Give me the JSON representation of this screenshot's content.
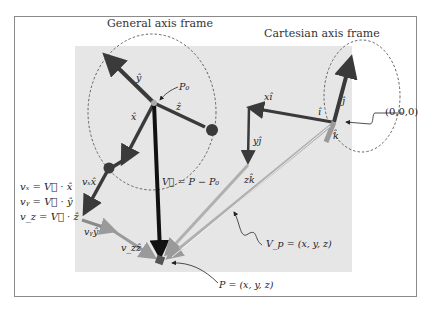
{
  "diagram": {
    "titles": {
      "general": "General axis frame",
      "cartesian": "Cartesian axis frame"
    },
    "labels": {
      "y_hat": "ŷ",
      "z_hat": "ẑ",
      "x_hat": "x̂",
      "p0": "P₀",
      "v_eq": "V⃗ = P − P₀",
      "vx_x": "vₓx̂",
      "vy_y": "vᵧŷ",
      "vz_z": "v_zẑ",
      "x_i": "xî",
      "i_hat": "î",
      "j_hat": "ĵ",
      "k_hat": "k̂",
      "y_j": "yĵ",
      "z_k": "zk̂",
      "origin": "(0,0,0)",
      "vp_eq": "V_p = (x, y, z)",
      "p_eq": "P = (x, y, z)"
    },
    "equations": [
      "vₓ = V⃗ · x̂",
      "vᵧ = V⃗ · ŷ",
      "v_z = V⃗ · ẑ"
    ],
    "colors": {
      "panel_bg": "#e6e6e6",
      "dark_arrow": "#3a3a3a",
      "black_arrow": "#111111",
      "light_arrow": "#b8b8b8",
      "border": "#8a8a8a"
    }
  }
}
